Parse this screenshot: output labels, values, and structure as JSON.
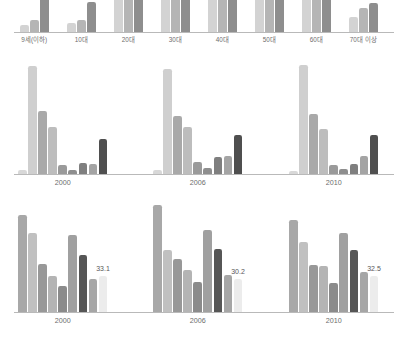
{
  "figure": {
    "background": "#ffffff",
    "axis_color": "#b9b9b9",
    "text_color": "#6d6d6d"
  },
  "palette": {
    "s1": "#d8d8d8",
    "s2": "#c9c9c9",
    "s3": "#b0b0b0",
    "s4": "#9d9d9d",
    "s5": "#8a8a8a",
    "s6": "#787878",
    "s7": "#636363",
    "s8": "#4f4f4f",
    "highlight": "#ececec"
  },
  "chart_data": [
    {
      "id": "age-distribution",
      "type": "bar",
      "title": "",
      "xlabel": "",
      "ylabel": "",
      "grid": false,
      "legend_position": "none",
      "note": "top panel is cropped by the image edge; bars continue above the frame",
      "categories": [
        "9세(이하)",
        "10대",
        "20대",
        "30대",
        "40대",
        "50대",
        "60대",
        "70대 이상"
      ],
      "series": [
        {
          "name": "series-1",
          "color": "#d3d3d3",
          "values": [
            6,
            8,
            60,
            60,
            60,
            60,
            60,
            14
          ]
        },
        {
          "name": "series-2",
          "color": "#b5b5b5",
          "values": [
            11,
            11,
            60,
            60,
            60,
            60,
            60,
            22
          ]
        },
        {
          "name": "series-3",
          "color": "#8e8e8e",
          "values": [
            60,
            27,
            60,
            60,
            60,
            60,
            60,
            26
          ]
        }
      ],
      "ylim": [
        0,
        60
      ]
    },
    {
      "id": "middle-trend",
      "type": "bar",
      "title": "",
      "xlabel": "",
      "ylabel": "",
      "grid": false,
      "legend_position": "none",
      "categories": [
        "2000",
        "2006",
        "2010"
      ],
      "series": [
        {
          "name": "cat-1",
          "color": "#d8d8d8",
          "values": [
            3.5,
            3.5,
            3.0
          ]
        },
        {
          "name": "cat-2",
          "color": "#cfcfcf",
          "values": [
            96.0,
            94.0,
            97.0
          ]
        },
        {
          "name": "cat-3",
          "color": "#a9a9a9",
          "values": [
            56.0,
            52.0,
            54.0
          ]
        },
        {
          "name": "cat-4",
          "color": "#bdbdbd",
          "values": [
            42.0,
            42.0,
            40.0
          ]
        },
        {
          "name": "cat-5",
          "color": "#9a9a9a",
          "values": [
            8.0,
            11.0,
            8.0
          ]
        },
        {
          "name": "cat-6",
          "color": "#8e8e8e",
          "values": [
            4.0,
            5.0,
            4.5
          ]
        },
        {
          "name": "cat-7",
          "color": "#7f7f7f",
          "values": [
            9.5,
            15.0,
            9.0
          ]
        },
        {
          "name": "cat-8",
          "color": "#a4a4a4",
          "values": [
            9.0,
            16.0,
            16.0
          ]
        },
        {
          "name": "cat-9",
          "color": "#4f4f4f",
          "values": [
            31.0,
            35.0,
            35.0
          ]
        }
      ],
      "ylim": [
        0,
        100
      ]
    },
    {
      "id": "bottom-index",
      "type": "bar",
      "title": "",
      "xlabel": "",
      "ylabel": "",
      "grid": false,
      "legend_position": "none",
      "categories": [
        "2000",
        "2006",
        "2010"
      ],
      "series": [
        {
          "name": "b1",
          "color": "#a8a8a8",
          "values": [
            88.0,
            97.0,
            84.0
          ]
        },
        {
          "name": "b2",
          "color": "#c0c0c0",
          "values": [
            72.0,
            56.0,
            64.0
          ]
        },
        {
          "name": "b3",
          "color": "#989898",
          "values": [
            44.0,
            48.0,
            43.0
          ]
        },
        {
          "name": "b4",
          "color": "#b4b4b4",
          "values": [
            33.0,
            38.0,
            42.0
          ]
        },
        {
          "name": "b5",
          "color": "#8b8b8b",
          "values": [
            24.0,
            27.0,
            26.0
          ]
        },
        {
          "name": "b6",
          "color": "#a0a0a0",
          "values": [
            70.0,
            75.0,
            72.0
          ]
        },
        {
          "name": "b7",
          "color": "#565656",
          "values": [
            52.0,
            57.0,
            56.0
          ]
        },
        {
          "name": "b8",
          "color": "#a6a6a6",
          "values": [
            30.0,
            34.0,
            36.0
          ]
        },
        {
          "name": "b9-highlight",
          "color": "#ececec",
          "values": [
            33.1,
            30.2,
            32.5
          ]
        }
      ],
      "labels": [
        "33.1",
        "30.2",
        "32.5"
      ],
      "ylim": [
        0,
        100
      ]
    }
  ]
}
